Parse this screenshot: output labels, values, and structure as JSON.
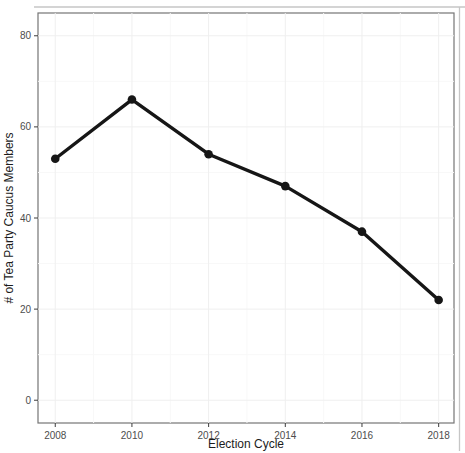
{
  "colors": {
    "background": "#ffffff",
    "line": "#161616",
    "point": "#161616",
    "panel_border": "#757575",
    "grid_major": "#efefef",
    "grid_minor": "#f8f8f8",
    "tick": "#3c3c3c",
    "tick_label": "#4d4d4d",
    "axis_title": "#1c1c1c",
    "scan_frame": "#c6c6c6"
  },
  "chart_data": {
    "type": "line",
    "title": "",
    "xlabel": "Election Cycle",
    "ylabel": "# of Tea Party Caucus Members",
    "x": [
      2008,
      2010,
      2012,
      2014,
      2016,
      2018
    ],
    "x_tick_labels": [
      "2008",
      "2010",
      "2012",
      "2014",
      "2016",
      "2018"
    ],
    "values": [
      53,
      66,
      54,
      47,
      37,
      22
    ],
    "y_ticks": [
      0,
      20,
      40,
      60,
      80
    ],
    "y_minor_ticks": [
      10,
      30,
      50,
      70
    ],
    "x_minor_ticks": [
      2009,
      2011,
      2013,
      2015,
      2017
    ],
    "xlim": [
      2007.55,
      2018.4
    ],
    "ylim": [
      -5,
      85
    ],
    "grid": "very faint major and minor gridlines on white panel",
    "legend": "none",
    "style": "theme_bw-like panel with thin gray border; single thick black line with filled round markers"
  }
}
